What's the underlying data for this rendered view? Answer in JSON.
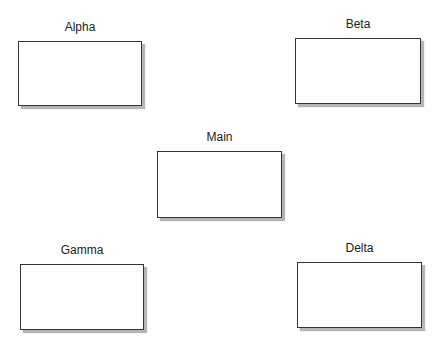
{
  "diagram": {
    "nodes": [
      {
        "id": "alpha",
        "label": "Alpha",
        "x": 18,
        "y": 41,
        "w": 124,
        "h": 65
      },
      {
        "id": "beta",
        "label": "Beta",
        "x": 295,
        "y": 38,
        "w": 126,
        "h": 66
      },
      {
        "id": "main",
        "label": "Main",
        "x": 157,
        "y": 151,
        "w": 125,
        "h": 67
      },
      {
        "id": "gamma",
        "label": "Gamma",
        "x": 20,
        "y": 264,
        "w": 124,
        "h": 66
      },
      {
        "id": "delta",
        "label": "Delta",
        "x": 297,
        "y": 262,
        "w": 125,
        "h": 66
      }
    ],
    "colors": {
      "border": "#333333",
      "shadow": "#b5b5b5",
      "fill": "#ffffff",
      "text": "#222222"
    }
  }
}
